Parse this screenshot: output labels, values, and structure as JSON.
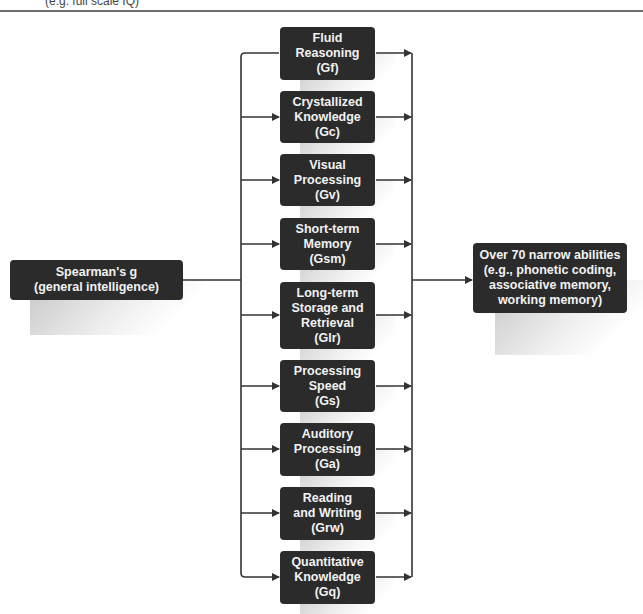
{
  "header": {
    "caption": "(e.g. full scale IQ)"
  },
  "root": {
    "label": "Spearman's g\n(general intelligence)"
  },
  "abilities": [
    {
      "label": "Fluid\nReasoning\n(Gf)"
    },
    {
      "label": "Crystallized\nKnowledge\n(Gc)"
    },
    {
      "label": "Visual\nProcessing\n(Gv)"
    },
    {
      "label": "Short-term\nMemory\n(Gsm)"
    },
    {
      "label": "Long-term\nStorage and\nRetrieval\n(Glr)"
    },
    {
      "label": "Processing\nSpeed\n(Gs)"
    },
    {
      "label": "Auditory\nProcessing\n(Ga)"
    },
    {
      "label": "Reading\nand Writing\n(Grw)"
    },
    {
      "label": "Quantitative\nKnowledge\n(Gq)"
    }
  ],
  "target": {
    "label": "Over 70 narrow abilities\n(e.g., phonetic coding,\nassociative memory,\nworking memory)"
  },
  "colors": {
    "box": "#2b2b2b",
    "text": "#f2f2f2",
    "line": "#333333"
  }
}
